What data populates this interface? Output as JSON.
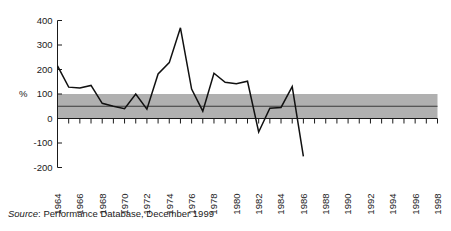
{
  "source_note": {
    "prefix": "Source",
    "text": ": Performance Database, December 1999"
  },
  "chart_data": {
    "type": "line",
    "title": "",
    "subtitle": "",
    "xlabel": "",
    "ylabel": "%",
    "ylim": [
      -200,
      400
    ],
    "xlim": [
      1964,
      1998
    ],
    "grid": false,
    "legend": false,
    "ytick_labels": [
      "400",
      "300",
      "200",
      "100",
      "0",
      "-100",
      "-200"
    ],
    "ytick_values": [
      400,
      300,
      200,
      100,
      0,
      -100,
      -200
    ],
    "xtick_labels": [
      "1964",
      "1966",
      "1968",
      "1970",
      "1972",
      "1974",
      "1976",
      "1978",
      "1980",
      "1982",
      "1984",
      "1986",
      "1988",
      "1990",
      "1992",
      "1994",
      "1996",
      "1998"
    ],
    "xtick_values": [
      1964,
      1966,
      1968,
      1970,
      1972,
      1974,
      1976,
      1978,
      1980,
      1982,
      1984,
      1986,
      1988,
      1990,
      1992,
      1994,
      1996,
      1998
    ],
    "minor_ticks_every": 1,
    "colors": {
      "line": "#111111",
      "band_fill": "#b0b0b0",
      "band_midline": "#3a3a3a",
      "axis": "#1a1a1a"
    },
    "annotations": [
      {
        "name": "reference-band",
        "label": "",
        "y_from": 0,
        "y_to": 100
      },
      {
        "name": "reference-midline",
        "label": "",
        "y": 50
      }
    ],
    "series": [
      {
        "name": "performance",
        "x": [
          1964,
          1965,
          1966,
          1967,
          1968,
          1969,
          1970,
          1971,
          1972,
          1973,
          1974,
          1975,
          1976,
          1977,
          1978,
          1979,
          1980,
          1981,
          1982,
          1983,
          1984,
          1985,
          1986
        ],
        "values": [
          215,
          128,
          125,
          135,
          62,
          50,
          40,
          100,
          38,
          182,
          228,
          370,
          120,
          30,
          185,
          148,
          142,
          152,
          -55,
          42,
          45,
          130,
          -155
        ]
      }
    ]
  }
}
